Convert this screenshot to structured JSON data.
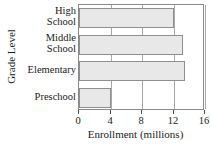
{
  "chart_data": {
    "type": "bar",
    "orientation": "horizontal",
    "title": "",
    "xlabel": "Enrollment (millions)",
    "ylabel": "Grade Level",
    "categories": [
      "High School",
      "Middle School",
      "Elementary",
      "Preschool"
    ],
    "category_lines": [
      [
        "High",
        "School"
      ],
      [
        "Middle",
        "School"
      ],
      [
        "Elementary"
      ],
      [
        "Preschool"
      ]
    ],
    "values": [
      12.0,
      13.2,
      13.5,
      4.0
    ],
    "xlim": [
      0,
      16
    ],
    "xticks": [
      0,
      4,
      8,
      12,
      16
    ],
    "xtick_labels": [
      "0",
      "4",
      "8",
      "12",
      "16"
    ],
    "grid": "vertical",
    "legend": "none",
    "colors": {
      "bar_fill": "#e8e8e8",
      "bar_border": "#8f8f8f",
      "gridline": "#a8a8a8",
      "frame": "#8a8a8a",
      "text": "#1a1a1a"
    }
  }
}
